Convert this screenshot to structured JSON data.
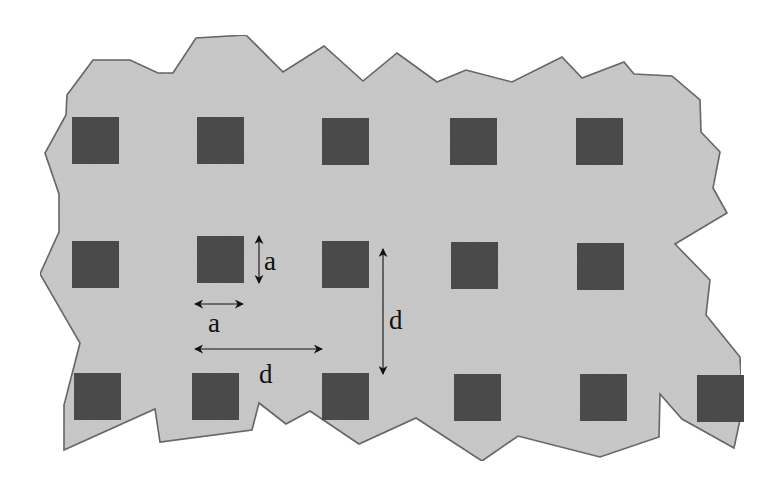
{
  "diagram": {
    "type": "periodic-lattice",
    "colors": {
      "matrix_fill": "#c8c8c8",
      "matrix_stroke": "#5a5a5a",
      "inclusion_fill": "#4a4a4a",
      "annotation": "#111111",
      "background": "#ffffff"
    },
    "matrix_outline": [
      [
        67,
        95
      ],
      [
        93,
        60
      ],
      [
        130,
        60
      ],
      [
        158,
        73
      ],
      [
        173,
        73
      ],
      [
        196,
        38
      ],
      [
        246,
        35
      ],
      [
        283,
        72
      ],
      [
        324,
        46
      ],
      [
        363,
        81
      ],
      [
        397,
        53
      ],
      [
        437,
        82
      ],
      [
        466,
        70
      ],
      [
        512,
        82
      ],
      [
        562,
        57
      ],
      [
        582,
        78
      ],
      [
        624,
        62
      ],
      [
        634,
        74
      ],
      [
        672,
        76
      ],
      [
        700,
        100
      ],
      [
        701,
        132
      ],
      [
        720,
        152
      ],
      [
        713,
        188
      ],
      [
        727,
        213
      ],
      [
        675,
        244
      ],
      [
        710,
        280
      ],
      [
        706,
        315
      ],
      [
        740,
        357
      ],
      [
        741,
        375
      ],
      [
        740,
        420
      ],
      [
        734,
        448
      ],
      [
        682,
        419
      ],
      [
        660,
        394
      ],
      [
        659,
        437
      ],
      [
        600,
        457
      ],
      [
        518,
        436
      ],
      [
        482,
        461
      ],
      [
        416,
        418
      ],
      [
        359,
        444
      ],
      [
        310,
        411
      ],
      [
        286,
        424
      ],
      [
        259,
        403
      ],
      [
        252,
        430
      ],
      [
        160,
        442
      ],
      [
        155,
        409
      ],
      [
        64,
        450
      ],
      [
        64,
        405
      ],
      [
        80,
        343
      ],
      [
        40,
        274
      ],
      [
        59,
        232
      ],
      [
        59,
        194
      ],
      [
        45,
        153
      ],
      [
        66,
        115
      ]
    ],
    "inclusion_size": 47,
    "inclusions": [
      {
        "row": 1,
        "col": 1,
        "x": 72,
        "y": 117
      },
      {
        "row": 1,
        "col": 2,
        "x": 197,
        "y": 117
      },
      {
        "row": 1,
        "col": 3,
        "x": 322,
        "y": 118
      },
      {
        "row": 1,
        "col": 4,
        "x": 450,
        "y": 118
      },
      {
        "row": 1,
        "col": 5,
        "x": 576,
        "y": 118
      },
      {
        "row": 2,
        "col": 1,
        "x": 72,
        "y": 241
      },
      {
        "row": 2,
        "col": 2,
        "x": 197,
        "y": 236
      },
      {
        "row": 2,
        "col": 3,
        "x": 322,
        "y": 241
      },
      {
        "row": 2,
        "col": 4,
        "x": 451,
        "y": 242
      },
      {
        "row": 2,
        "col": 5,
        "x": 577,
        "y": 243
      },
      {
        "row": 3,
        "col": 1,
        "x": 74,
        "y": 373
      },
      {
        "row": 3,
        "col": 2,
        "x": 192,
        "y": 373
      },
      {
        "row": 3,
        "col": 3,
        "x": 322,
        "y": 373
      },
      {
        "row": 3,
        "col": 4,
        "x": 454,
        "y": 374
      },
      {
        "row": 3,
        "col": 5,
        "x": 580,
        "y": 374
      },
      {
        "row": 3,
        "col": 6,
        "x": 697,
        "y": 375
      }
    ],
    "annotations": [
      {
        "id": "a-vertical",
        "label": "a",
        "orientation": "vertical",
        "x1": 259,
        "y1": 236,
        "x2": 259,
        "y2": 283,
        "label_x": 264,
        "label_y": 270
      },
      {
        "id": "a-horizontal",
        "label": "a",
        "orientation": "horizontal",
        "x1": 195,
        "y1": 304,
        "x2": 243,
        "y2": 304,
        "label_x": 208,
        "label_y": 332
      },
      {
        "id": "d-horizontal",
        "label": "d",
        "orientation": "horizontal",
        "x1": 195,
        "y1": 349,
        "x2": 322,
        "y2": 349,
        "label_x": 259,
        "label_y": 383
      },
      {
        "id": "d-vertical",
        "label": "d",
        "orientation": "vertical",
        "x1": 383,
        "y1": 249,
        "x2": 383,
        "y2": 374,
        "label_x": 389,
        "label_y": 329
      }
    ],
    "labels": {
      "side_length": "a",
      "period": "d"
    }
  }
}
